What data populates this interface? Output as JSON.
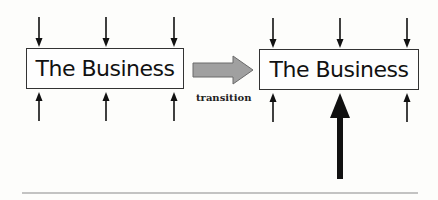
{
  "diagram": {
    "left_box": {
      "label": "The Business"
    },
    "right_box": {
      "label": "The Business"
    },
    "transition_arrow": {
      "caption": "transition",
      "color": "#9a9a9a"
    },
    "colors": {
      "stroke": "#111111",
      "box_border": "#333333",
      "baseline": "#8a8a8a",
      "background": "#fdfdfb"
    }
  }
}
